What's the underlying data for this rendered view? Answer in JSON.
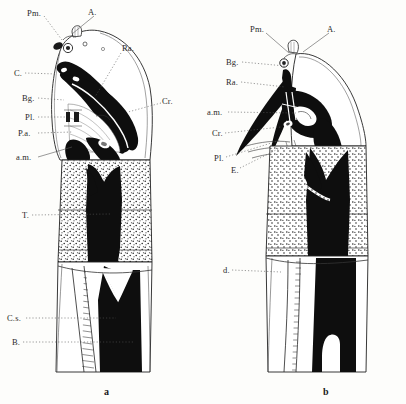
{
  "plate": {
    "background_color": "#fdfdfb",
    "ink_color": "#111111",
    "label_color": "#2a2a2a"
  },
  "figures": [
    {
      "caption": "a",
      "caption_x": 104,
      "caption_y": 386,
      "labels": [
        {
          "text": "Pm.",
          "x": 27,
          "y": 9,
          "lx1": 44,
          "ly1": 16,
          "lx2": 62,
          "ly2": 40,
          "style": "dotted"
        },
        {
          "text": "A.",
          "x": 88,
          "y": 8,
          "lx1": 94,
          "ly1": 16,
          "lx2": 72,
          "ly2": 34,
          "style": "solid"
        },
        {
          "text": "Ra.",
          "x": 122,
          "y": 44,
          "lx1": 121,
          "ly1": 53,
          "lx2": 95,
          "ly2": 97,
          "style": "dotted"
        },
        {
          "text": "C.",
          "x": 14,
          "y": 69,
          "lx1": 25,
          "ly1": 73,
          "lx2": 57,
          "ly2": 74,
          "style": "dotted"
        },
        {
          "text": "Bg.",
          "x": 22,
          "y": 94,
          "lx1": 38,
          "ly1": 98,
          "lx2": 64,
          "ly2": 100,
          "style": "dotted"
        },
        {
          "text": "Cr.",
          "x": 162,
          "y": 97,
          "lx1": 161,
          "ly1": 103,
          "lx2": 128,
          "ly2": 112,
          "style": "dotted"
        },
        {
          "text": "Pl.",
          "x": 25,
          "y": 113,
          "lx1": 38,
          "ly1": 117,
          "lx2": 66,
          "ly2": 117,
          "style": "dotted"
        },
        {
          "text": "P.a.",
          "x": 18,
          "y": 129,
          "lx1": 38,
          "ly1": 133,
          "lx2": 72,
          "ly2": 132,
          "style": "dotted"
        },
        {
          "text": "a.m.",
          "x": 16,
          "y": 153,
          "lx1": 38,
          "ly1": 157,
          "lx2": 72,
          "ly2": 147,
          "style": "solid"
        },
        {
          "text": "T.",
          "x": 22,
          "y": 211,
          "lx1": 32,
          "ly1": 215,
          "lx2": 110,
          "ly2": 214,
          "style": "dotted"
        },
        {
          "text": "C.s.",
          "x": 7,
          "y": 314,
          "lx1": 26,
          "ly1": 318,
          "lx2": 116,
          "ly2": 318,
          "style": "dotted"
        },
        {
          "text": "B.",
          "x": 12,
          "y": 338,
          "lx1": 23,
          "ly1": 342,
          "lx2": 133,
          "ly2": 342,
          "style": "dotted"
        }
      ]
    },
    {
      "caption": "b",
      "caption_x": 323,
      "caption_y": 386,
      "labels": [
        {
          "text": "Pm.",
          "x": 250,
          "y": 25,
          "lx1": 266,
          "ly1": 33,
          "lx2": 289,
          "ly2": 53,
          "style": "solid"
        },
        {
          "text": "A.",
          "x": 327,
          "y": 25,
          "lx1": 329,
          "ly1": 33,
          "lx2": 303,
          "ly2": 52,
          "style": "solid"
        },
        {
          "text": "Bg.",
          "x": 226,
          "y": 58,
          "lx1": 242,
          "ly1": 62,
          "lx2": 285,
          "ly2": 66,
          "style": "dotted"
        },
        {
          "text": "Ra.",
          "x": 226,
          "y": 78,
          "lx1": 241,
          "ly1": 82,
          "lx2": 285,
          "ly2": 87,
          "style": "dotted"
        },
        {
          "text": "a.m.",
          "x": 207,
          "y": 108,
          "lx1": 228,
          "ly1": 112,
          "lx2": 296,
          "ly2": 113,
          "style": "dotted"
        },
        {
          "text": "Cr.",
          "x": 212,
          "y": 129,
          "lx1": 225,
          "ly1": 133,
          "lx2": 281,
          "ly2": 127,
          "style": "dotted"
        },
        {
          "text": "Pl.",
          "x": 214,
          "y": 154,
          "lx1": 226,
          "ly1": 157,
          "lx2": 281,
          "ly2": 140,
          "style": "dotted"
        },
        {
          "text": "E.",
          "x": 231,
          "y": 166,
          "lx1": 240,
          "ly1": 168,
          "lx2": 280,
          "ly2": 148,
          "style": "dotted"
        },
        {
          "text": "d.",
          "x": 223,
          "y": 266,
          "lx1": 232,
          "ly1": 270,
          "lx2": 281,
          "ly2": 272,
          "style": "dotted"
        }
      ]
    }
  ]
}
